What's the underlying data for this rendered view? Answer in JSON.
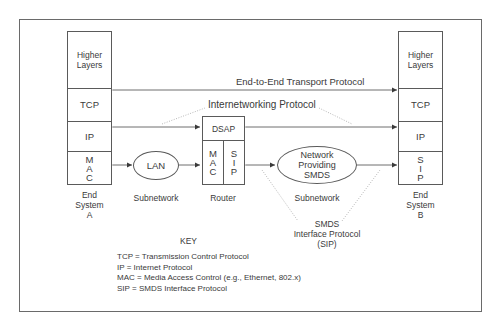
{
  "end_system_a": {
    "layers": [
      {
        "label": "Higher\nLayers",
        "lines": [
          "Higher",
          "Layers"
        ]
      },
      {
        "label": "TCP"
      },
      {
        "label": "IP"
      },
      {
        "label": "MAC",
        "letters": [
          "M",
          "A",
          "C"
        ]
      }
    ],
    "caption": [
      "End",
      "System",
      "A"
    ]
  },
  "end_system_b": {
    "layers": [
      {
        "label": "Higher\nLayers",
        "lines": [
          "Higher",
          "Layers"
        ]
      },
      {
        "label": "TCP"
      },
      {
        "label": "IP"
      },
      {
        "label": "SIP",
        "letters": [
          "S",
          "I",
          "P"
        ]
      }
    ],
    "caption": [
      "End",
      "System",
      "B"
    ]
  },
  "router": {
    "top": "DSAP",
    "left_letters": [
      "M",
      "A",
      "C"
    ],
    "right_letters": [
      "S",
      "I",
      "P"
    ],
    "caption": "Router"
  },
  "lan": {
    "label": "LAN",
    "caption": "Subnetwork"
  },
  "smds_network": {
    "lines": [
      "Network",
      "Providing",
      "SMDS"
    ],
    "caption": "Subnetwork"
  },
  "protocols": {
    "end_to_end": "End-to-End Transport Protocol",
    "internetworking": "Internetworking Protocol",
    "sip_callout": [
      "SMDS",
      "Interface Protocol",
      "(SIP)"
    ]
  },
  "key": {
    "title": "KEY",
    "entries": [
      {
        "abbr": "TCP",
        "eq": "=",
        "meaning": "Transmission Control Protocol"
      },
      {
        "abbr": "IP",
        "eq": "=",
        "meaning": "Internet Protocol"
      },
      {
        "abbr": "MAC",
        "eq": "=",
        "meaning": "Media Access Control (e.g., Ethernet, 802.x)"
      },
      {
        "abbr": "SIP",
        "eq": "=",
        "meaning": "SMDS Interface Protocol"
      }
    ]
  },
  "colors": {
    "line": "#4a4a4a",
    "dotted": "#9a9a9a",
    "text": "#3a3a3a",
    "background": "#ffffff"
  }
}
